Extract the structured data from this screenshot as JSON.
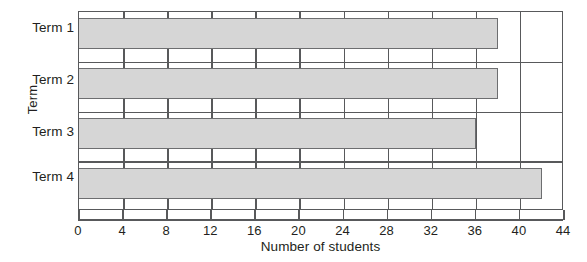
{
  "chart_data": {
    "type": "bar",
    "orientation": "horizontal",
    "title": "",
    "categories": [
      "Term 1",
      "Term 2",
      "Term 3",
      "Term 4"
    ],
    "values": [
      38,
      38,
      36,
      42
    ],
    "xlabel": "Number of students",
    "ylabel": "Term",
    "xlim": [
      0,
      44
    ],
    "xticks": [
      0,
      4,
      8,
      12,
      16,
      20,
      24,
      28,
      32,
      36,
      40,
      44
    ],
    "xtick_labels": [
      "0",
      "4",
      "8",
      "12",
      "16",
      "20",
      "24",
      "28",
      "32",
      "36",
      "40",
      "44"
    ],
    "grid": "vertical-only",
    "legend": "none",
    "bar_fill_color": "#d6d6d6",
    "bar_edge_color": "#6d6e70",
    "axis_color": "#58595b",
    "background_color": "#ffffff"
  },
  "axes": {
    "x_title": "Number of students",
    "y_title": "Term"
  }
}
